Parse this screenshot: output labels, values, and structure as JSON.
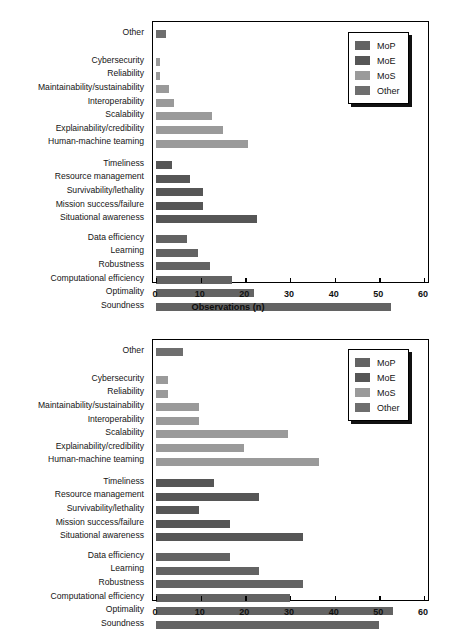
{
  "figure": {
    "panels": [
      {
        "id": "observations",
        "axis_title": "Observations (n)",
        "legend": {
          "title": "",
          "entries": [
            {
              "label": "MoP",
              "color": "#636363"
            },
            {
              "label": "MoE",
              "color": "#565656"
            },
            {
              "label": "MoS",
              "color": "#9a9a9a"
            },
            {
              "label": "Other",
              "color": "#6e6e6e"
            }
          ]
        },
        "ticks": [
          "0",
          "10",
          "20",
          "30",
          "40",
          "50",
          "60"
        ]
      },
      {
        "id": "percent",
        "axis_title": "Percent programs",
        "legend": {
          "title": "",
          "entries": [
            {
              "label": "MoP",
              "color": "#636363"
            },
            {
              "label": "MoE",
              "color": "#565656"
            },
            {
              "label": "MoS",
              "color": "#9a9a9a"
            },
            {
              "label": "Other",
              "color": "#6e6e6e"
            }
          ]
        },
        "ticks": [
          "0",
          "10",
          "20",
          "30",
          "40",
          "50",
          "60"
        ]
      }
    ]
  },
  "chart_data": [
    {
      "type": "bar",
      "orientation": "horizontal",
      "title": "",
      "xlabel": "Observations (n)",
      "ylabel": "",
      "xlim": [
        0,
        60
      ],
      "xticks": [
        0,
        10,
        20,
        30,
        40,
        50,
        60
      ],
      "grid": false,
      "legend_position": "top-right",
      "legend": [
        "MoP",
        "MoE",
        "MoS",
        "Other"
      ],
      "groups": [
        {
          "name": "Other",
          "color": "#6e6e6e",
          "categories": [
            "Other"
          ],
          "values": [
            2.2
          ]
        },
        {
          "name": "MoS",
          "color": "#9a9a9a",
          "categories": [
            "Cybersecurity",
            "Reliability",
            "Maintainability/sustainability",
            "Interoperability",
            "Scalability",
            "Explainability/credibility",
            "Human-machine teaming"
          ],
          "values": [
            1,
            1,
            3,
            4,
            12.5,
            15,
            20.5
          ]
        },
        {
          "name": "MoE",
          "color": "#565656",
          "categories": [
            "Timeliness",
            "Resource management",
            "Survivability/lethality",
            "Mission success/failure",
            "Situational awareness"
          ],
          "values": [
            3.5,
            7.5,
            10.5,
            10.5,
            22.5
          ]
        },
        {
          "name": "MoP",
          "color": "#636363",
          "categories": [
            "Data efficiency",
            "Learning",
            "Robustness",
            "Computational efficiency",
            "Optimality",
            "Soundness"
          ],
          "values": [
            7,
            9.5,
            12,
            17,
            22,
            52.5
          ]
        }
      ]
    },
    {
      "type": "bar",
      "orientation": "horizontal",
      "title": "",
      "xlabel": "Percent programs",
      "ylabel": "",
      "xlim": [
        0,
        60
      ],
      "xticks": [
        0,
        10,
        20,
        30,
        40,
        50,
        60
      ],
      "grid": false,
      "legend_position": "top-right",
      "legend": [
        "MoP",
        "MoE",
        "MoS",
        "Other"
      ],
      "groups": [
        {
          "name": "Other",
          "color": "#6e6e6e",
          "categories": [
            "Other"
          ],
          "values": [
            6
          ]
        },
        {
          "name": "MoS",
          "color": "#9a9a9a",
          "categories": [
            "Cybersecurity",
            "Reliability",
            "Maintainability/sustainability",
            "Interoperability",
            "Scalability",
            "Explainability/credibility",
            "Human-machine teaming"
          ],
          "values": [
            2.6,
            2.6,
            9.7,
            9.7,
            29.5,
            19.6,
            36.4
          ]
        },
        {
          "name": "MoE",
          "color": "#565656",
          "categories": [
            "Timeliness",
            "Resource management",
            "Survivability/lethality",
            "Mission success/failure",
            "Situational awareness"
          ],
          "values": [
            13,
            23,
            9.7,
            16.5,
            33
          ]
        },
        {
          "name": "MoP",
          "color": "#636363",
          "categories": [
            "Data efficiency",
            "Learning",
            "Robustness",
            "Computational efficiency",
            "Optimality",
            "Soundness"
          ],
          "values": [
            16.5,
            23,
            33,
            30,
            53,
            50
          ]
        }
      ]
    }
  ]
}
